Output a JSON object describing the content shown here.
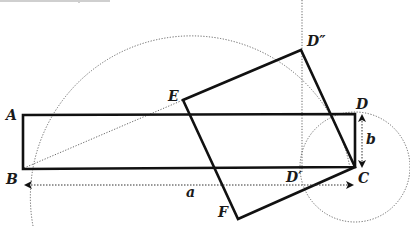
{
  "figure": {
    "type": "geometric-construction",
    "labels": {
      "A": "A",
      "B": "B",
      "C": "C",
      "D": "D",
      "D_double_prime": "D″",
      "D_prime": "D′",
      "E": "E",
      "F": "F",
      "a": "a",
      "b": "b"
    },
    "points": {
      "A": [
        23,
        115
      ],
      "B": [
        23,
        169
      ],
      "C": [
        355,
        167
      ],
      "D": [
        355,
        114
      ],
      "D_double_prime": [
        301,
        50
      ],
      "D_prime": [
        302,
        168
      ],
      "E": [
        183,
        100
      ],
      "F": [
        238,
        219
      ]
    },
    "shapes": {
      "rectangle": "ABCD",
      "square": "E D″ C F",
      "large_arc": {
        "center": [
          190,
          168
        ],
        "radius": 160
      },
      "small_circle": {
        "center": [
          355,
          167
        ],
        "radius": 55
      }
    },
    "dimensions": {
      "a": "length BC (horizontal side)",
      "b": "length CD (vertical side)"
    }
  }
}
